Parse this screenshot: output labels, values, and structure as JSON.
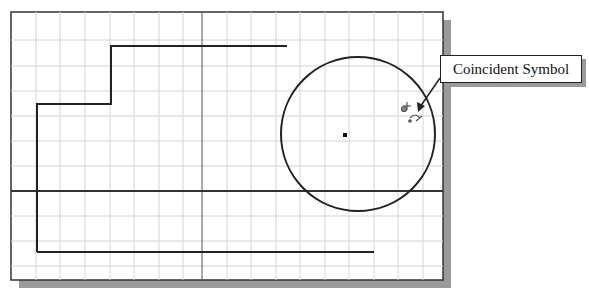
{
  "figure": {
    "callout": {
      "label": "Coincident Symbol"
    },
    "colors": {
      "grid": "#d8d8d8",
      "lines": "#222222",
      "shadow": "#9a9a9a",
      "background": "#ffffff"
    }
  },
  "geometry": {
    "frame": {
      "x": 11,
      "y": 12,
      "w": 432,
      "h": 268
    },
    "grid_spacing": 24.5,
    "axis_vertical_x": 202,
    "axis_horizontal_y": 191,
    "circle": {
      "cx": 345,
      "cy": 136,
      "r": 77
    },
    "step_polyline": "37,252 37,104 111,104 111,46 287,46",
    "bottom_line": {
      "x1": 37,
      "y1": 252,
      "x2": 374,
      "y2": 252
    }
  }
}
